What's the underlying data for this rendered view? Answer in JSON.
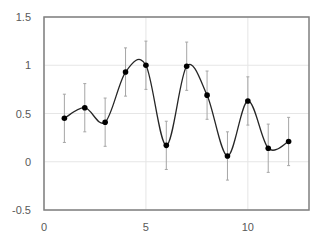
{
  "chart_data": {
    "type": "scatter",
    "title": "",
    "xlabel": "",
    "ylabel": "",
    "xlim": [
      0,
      13
    ],
    "ylim": [
      -0.5,
      1.5
    ],
    "x_ticks": [
      0,
      5,
      10
    ],
    "y_ticks": [
      -0.5,
      0,
      0.5,
      1,
      1.5
    ],
    "x_tick_labels": [
      "0",
      "5",
      "10"
    ],
    "y_tick_labels": [
      "-0.5",
      "0",
      "0.5",
      "1",
      "1.5"
    ],
    "grid": true,
    "legend": "none",
    "smoothed_line": true,
    "series": [
      {
        "name": "Series1",
        "x": [
          1,
          2,
          3,
          4,
          5,
          6,
          7,
          8,
          9,
          10,
          11,
          12
        ],
        "y": [
          0.45,
          0.56,
          0.41,
          0.93,
          1.0,
          0.17,
          0.99,
          0.69,
          0.06,
          0.63,
          0.14,
          0.21
        ],
        "error": [
          0.25,
          0.25,
          0.25,
          0.25,
          0.25,
          0.25,
          0.25,
          0.25,
          0.25,
          0.25,
          0.25,
          0.25
        ]
      }
    ]
  }
}
